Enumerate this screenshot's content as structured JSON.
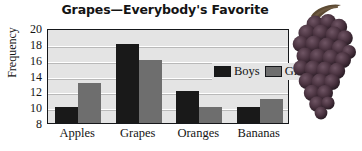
{
  "chart_data": {
    "type": "bar",
    "title": "Grapes—Everybody's Favorite",
    "xlabel": "",
    "ylabel": "Frequency",
    "categories": [
      "Apples",
      "Grapes",
      "Oranges",
      "Bananas"
    ],
    "series": [
      {
        "name": "Boys",
        "values": [
          10,
          18,
          12,
          10
        ],
        "color": "#191919"
      },
      {
        "name": "Girls",
        "values": [
          13,
          16,
          10,
          11
        ],
        "color": "#6e6e6e"
      }
    ],
    "ylim": [
      8,
      20
    ],
    "ytick_labels": [
      "20",
      "18",
      "16",
      "14",
      "12",
      "10",
      "8"
    ],
    "ytick_values": [
      20,
      18,
      16,
      14,
      12,
      10,
      8
    ],
    "grid": true,
    "legend_position": "top-right-inside",
    "plot_background": "#e4e4e4",
    "gridline_color": "#ffffff",
    "axis_color": "#15171a"
  },
  "decoration": {
    "grapes_image_name": "grape-cluster-illustration",
    "grape_color": "#4a3340",
    "grape_highlight": "#6b4f5e",
    "stem_color": "#5c4a33"
  }
}
